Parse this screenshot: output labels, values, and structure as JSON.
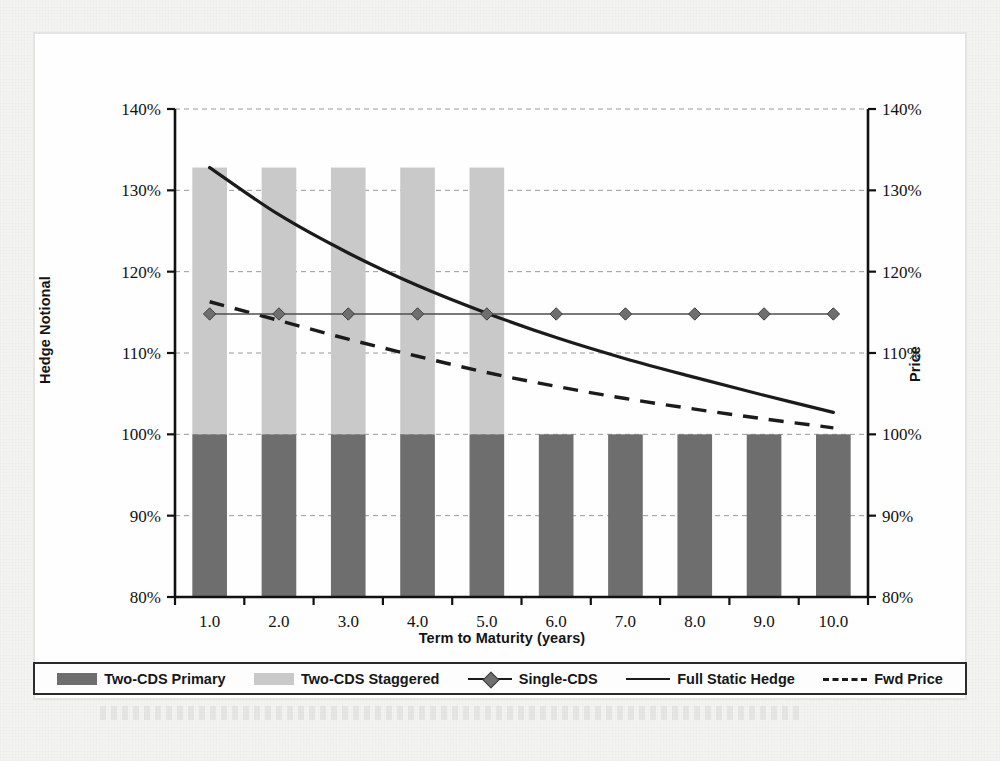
{
  "figure": {
    "background_color": "#f3f3f2",
    "frame_color": "#e4e4e2"
  },
  "chart_data": {
    "type": "bar",
    "title": "",
    "subtitle": "",
    "xlabel": "Term to Maturity (years)",
    "ylabel": "Hedge Notional",
    "ylabel_right": "Price",
    "x": [
      1.0,
      2.0,
      3.0,
      4.0,
      5.0,
      6.0,
      7.0,
      8.0,
      9.0,
      10.0
    ],
    "xtick_labels": [
      "1.0",
      "2.0",
      "3.0",
      "4.0",
      "5.0",
      "6.0",
      "7.0",
      "8.0",
      "9.0",
      "10.0"
    ],
    "ytick_labels": [
      "140%",
      "130%",
      "120%",
      "110%",
      "100%",
      "90%",
      "80%"
    ],
    "ytick_labels_right": [
      "140%",
      "130%",
      "120%",
      "110%",
      "100%",
      "90%",
      "80%"
    ],
    "ylim": [
      80,
      140
    ],
    "ylim_right": [
      80,
      140
    ],
    "ytick_values": [
      140,
      130,
      120,
      110,
      100,
      90,
      80
    ],
    "grid": true,
    "grid_style": "dashed-horizontal",
    "legend_position": "below-plot",
    "series": [
      {
        "name": "Two-CDS Primary",
        "type": "bar",
        "color": "#6e6e6e",
        "base": 80,
        "values": [
          100,
          100,
          100,
          100,
          100,
          100,
          100,
          100,
          100,
          100
        ]
      },
      {
        "name": "Two-CDS Staggered",
        "type": "bar",
        "color": "#c9c9c9",
        "base": 100,
        "values": [
          132.8,
          132.8,
          132.8,
          132.8,
          132.8,
          null,
          null,
          null,
          null,
          null
        ]
      },
      {
        "name": "Single-CDS",
        "type": "line-marker",
        "color": "#6f6f6f",
        "marker": "diamond",
        "values": [
          114.8,
          114.8,
          114.8,
          114.8,
          114.8,
          114.8,
          114.8,
          114.8,
          114.8,
          114.8
        ]
      },
      {
        "name": "Full Static Hedge",
        "type": "line",
        "color": "#1b1b1b",
        "style": "solid",
        "values": [
          132.8,
          127.0,
          122.3,
          118.3,
          114.9,
          111.9,
          109.3,
          107.0,
          104.8,
          102.7
        ]
      },
      {
        "name": "Fwd Price",
        "type": "line",
        "color": "#1b1b1b",
        "style": "dashed",
        "values": [
          116.3,
          114.0,
          111.7,
          109.6,
          107.6,
          105.9,
          104.4,
          103.1,
          101.9,
          100.8
        ]
      }
    ]
  },
  "legend": {
    "items": [
      {
        "label": "Two-CDS Primary",
        "swatch": "bar",
        "color": "#6e6e6e"
      },
      {
        "label": "Two-CDS Staggered",
        "swatch": "bar",
        "color": "#c9c9c9"
      },
      {
        "label": "Single-CDS",
        "swatch": "line-diamond",
        "color": "#6f6f6f"
      },
      {
        "label": "Full Static Hedge",
        "swatch": "line-solid",
        "color": "#1b1b1b"
      },
      {
        "label": "Fwd Price",
        "swatch": "line-dashed",
        "color": "#1b1b1b"
      }
    ]
  }
}
